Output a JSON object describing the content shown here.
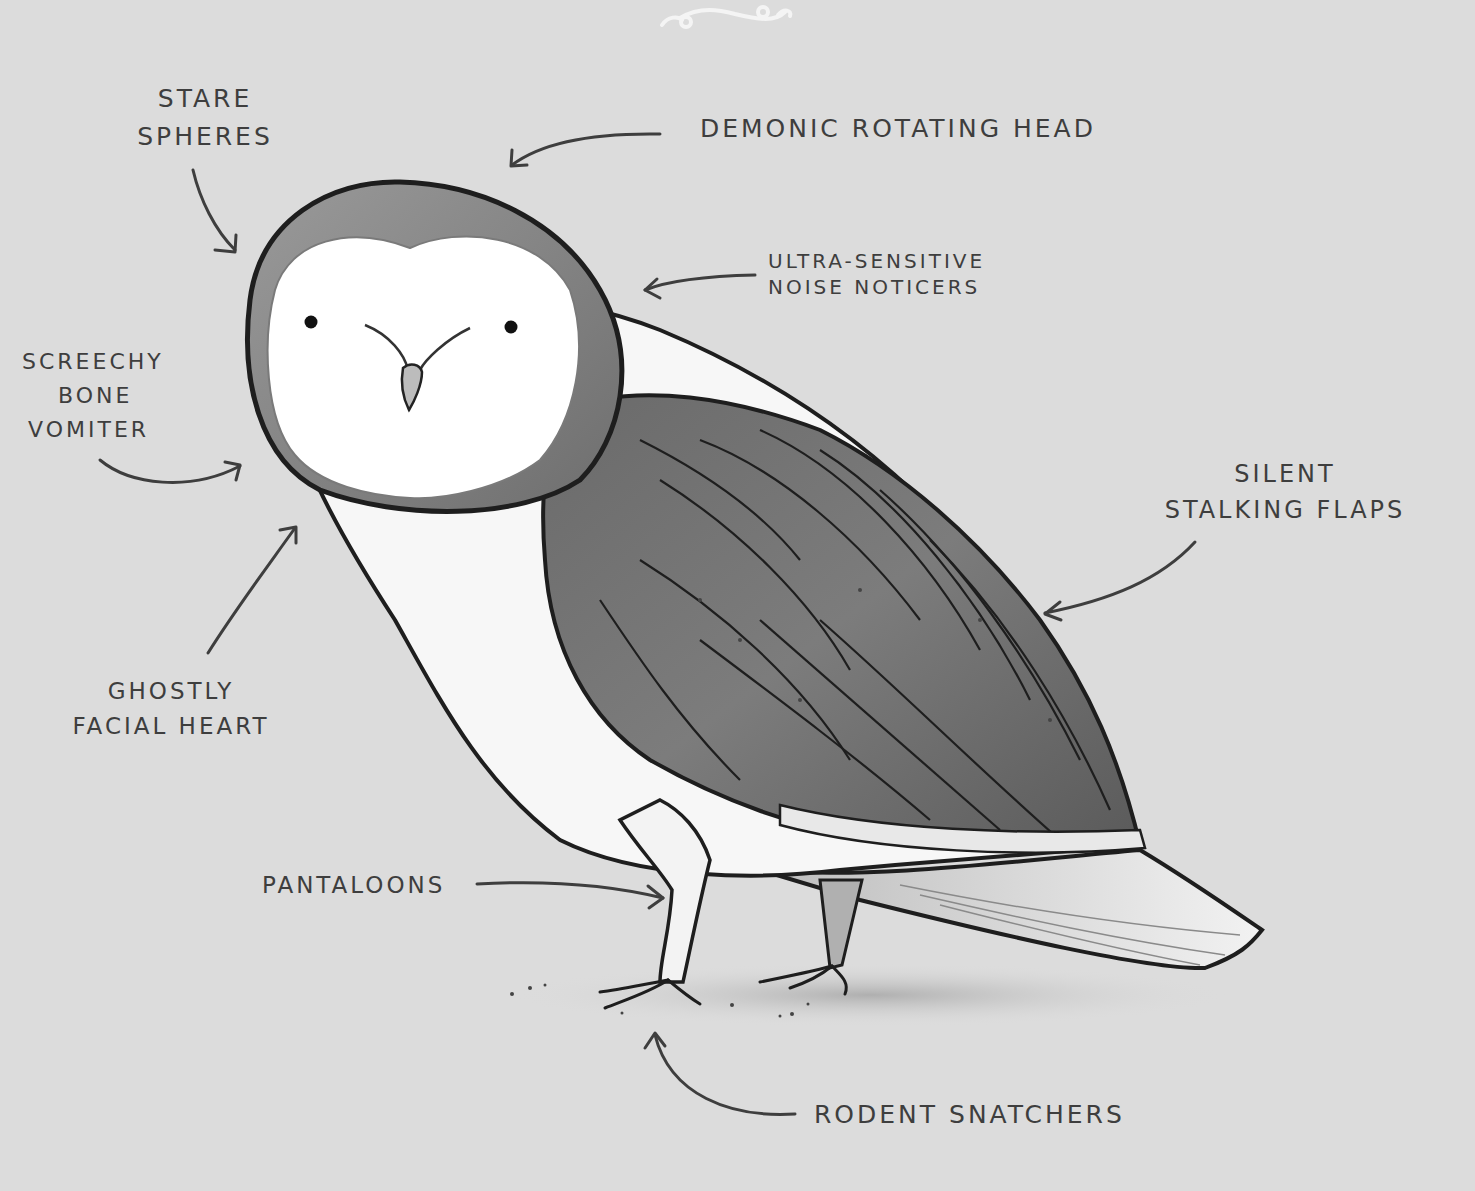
{
  "illustration": {
    "subject": "Barn owl anatomy (humorous)",
    "background_color": "#dcdcdc",
    "ink_color": "#3e3e3e",
    "ornament": "flourish-icon"
  },
  "labels": {
    "stare_spheres": {
      "line1": "Stare",
      "line2": "Spheres"
    },
    "demonic_head": {
      "line1": "Demonic Rotating Head"
    },
    "noise_noticers": {
      "line1": "Ultra-Sensitive",
      "line2": "Noise Noticers"
    },
    "bone_vomiter": {
      "line1": "Screechy",
      "line2": "Bone",
      "line3": "Vomiter"
    },
    "facial_heart": {
      "line1": "Ghostly",
      "line2": "Facial Heart"
    },
    "stalking_flaps": {
      "line1": "Silent",
      "line2": "Stalking Flaps"
    },
    "pantaloons": {
      "line1": "Pantaloons"
    },
    "rodent_snatchers": {
      "line1": "Rodent Snatchers"
    }
  }
}
